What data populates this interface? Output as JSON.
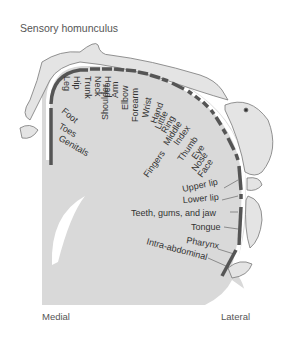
{
  "title": "Sensory homunculus",
  "axis": {
    "left": "Medial",
    "right": "Lateral"
  },
  "colors": {
    "cortex": "#d9d9d9",
    "segment": "#555555",
    "body": "#e4e4e4",
    "outline": "#777777",
    "text": "#333333"
  },
  "labels": {
    "leg": "Leg",
    "hip": "Hip",
    "trunk": "Trunk",
    "neck": "Neck",
    "head": "Head",
    "shoulder": "Shoulder",
    "arm": "Arm",
    "elbow": "Elbow",
    "forearm": "Forearm",
    "wrist": "Wrist",
    "hand": "Hand",
    "little": "Little",
    "ring": "Ring",
    "middle": "Middle",
    "index": "Index",
    "thumb": "Thumb",
    "fingers": "Fingers",
    "eye": "Eye",
    "nose": "Nose",
    "face": "Face",
    "upper_lip": "Upper lip",
    "lower_lip": "Lower lip",
    "teeth": "Teeth, gums, and jaw",
    "tongue": "Tongue",
    "pharynx": "Pharynx",
    "intra_abdominal": "Intra-abdominal",
    "foot": "Foot",
    "toes": "Toes",
    "genitals": "Genitals"
  }
}
